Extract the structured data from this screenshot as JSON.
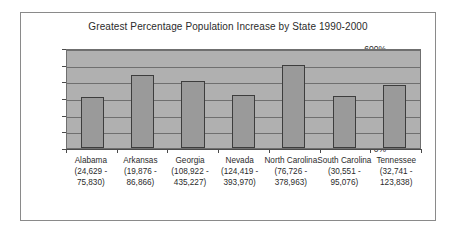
{
  "chart_data": {
    "type": "bar",
    "title": "Greatest Percentage Population Increase by State 1990-2000",
    "xlabel": "",
    "ylabel": "",
    "ylim": [
      0,
      600
    ],
    "ytick_step": 100,
    "grid": true,
    "legend": "none",
    "categories": [
      "Alabama",
      "Arkansas",
      "Georgia",
      "Nevada",
      "North Carolina",
      "South Carolina",
      "Tennessee"
    ],
    "category_ranges": [
      "(24,629 - 75,830)",
      "(19,876 - 86,866)",
      "(108,922 - 435,227)",
      "(124,419 - 393,970)",
      "(76,726 - 378,963)",
      "(30,551 - 95,076)",
      "(32,741 - 123,838)"
    ],
    "category_label_lines": [
      [
        "Alabama",
        "(24,629 -",
        "75,830)"
      ],
      [
        "Arkansas",
        "(19,876 -",
        "86,866)"
      ],
      [
        "Georgia",
        "(108,922 -",
        "435,227)"
      ],
      [
        "Nevada",
        "(124,419 -",
        "393,970)"
      ],
      [
        "North Carolina",
        "(76,726 -",
        "378,963)"
      ],
      [
        "South Carolina",
        "(30,551 -",
        "95,076)"
      ],
      [
        "Tennessee",
        "(32,741 -",
        "123,838)"
      ]
    ],
    "values": [
      308,
      437,
      400,
      318,
      497,
      311,
      381
    ],
    "ytick_labels": [
      "600%",
      "500%",
      "400%",
      "300%",
      "200%",
      "100%",
      "0%"
    ],
    "ytick_values": [
      600,
      500,
      400,
      300,
      200,
      100,
      0
    ]
  },
  "style": {
    "bar_fill": "#9a9a9a",
    "bar_stroke": "#3d3d3d",
    "plot_background": "#b0b0b0",
    "gridline_color": "#6f6f6f",
    "frame_border": "#8a8a8a",
    "text_color": "#2b2b2b",
    "page_background": "#ffffff"
  }
}
